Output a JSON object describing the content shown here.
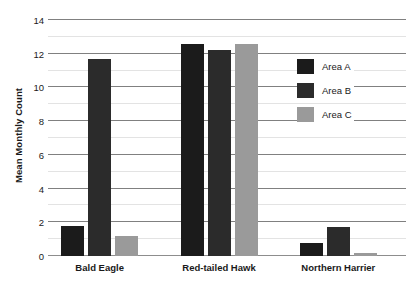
{
  "chart_data": {
    "type": "bar",
    "title": "",
    "subtitle": "",
    "xlabel": "",
    "ylabel": "Mean Monthly Count",
    "ylim": [
      0,
      14
    ],
    "ytick_labels": [
      "0",
      "2",
      "4",
      "6",
      "8",
      "10",
      "12",
      "14"
    ],
    "yticks": [
      0,
      2,
      4,
      6,
      8,
      10,
      12,
      14
    ],
    "minor_yticks": [
      1,
      3,
      5,
      7,
      9,
      11,
      13
    ],
    "grid": "horizontal",
    "legend_position": "upper-right-inside",
    "categories": [
      "Bald Eagle",
      "Red-tailed Hawk",
      "Northern Harrier"
    ],
    "series": [
      {
        "name": "Area A",
        "color": "#1b1b1b",
        "values": [
          1.8,
          12.55,
          0.75
        ]
      },
      {
        "name": "Area B",
        "color": "#2b2b2b",
        "values": [
          11.7,
          12.25,
          1.75
        ]
      },
      {
        "name": "Area C",
        "color": "#9a9a9a",
        "values": [
          1.2,
          12.6,
          0.2
        ]
      }
    ],
    "annotations": []
  },
  "legend": {
    "items": [
      {
        "label": "Area A",
        "color": "#1b1b1b"
      },
      {
        "label": "Area B",
        "color": "#2b2b2b"
      },
      {
        "label": "Area C",
        "color": "#9a9a9a"
      }
    ]
  },
  "axes": {
    "y_title": "Mean Monthly Count",
    "gridline_color": "#808080",
    "minor_gridline_color": "#e3e3e3",
    "baseline_color": "#8d8d8d"
  },
  "background_color": "#ffffff",
  "text_color": "#1a1a1a"
}
